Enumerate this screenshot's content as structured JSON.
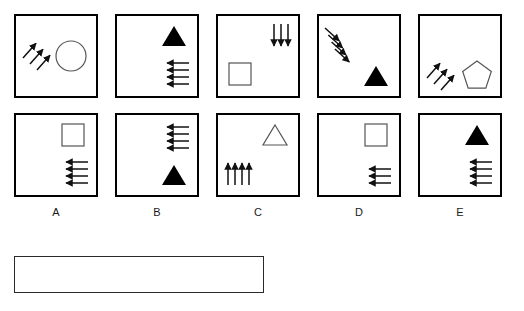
{
  "layout": {
    "columns": 5,
    "rows": 2,
    "panel_size": 84,
    "grid_origin": {
      "x": 14,
      "y": 14
    },
    "column_gap": 101,
    "row_gap": 99
  },
  "colors": {
    "panel_border": "#000000",
    "filled_shape": "#000000",
    "outline_shape": "#555555",
    "arrow": "#111111",
    "answer_box_border": "#2a2a2a",
    "background": "#ffffff",
    "label_text": "#1a1a1a"
  },
  "column_labels": [
    "A",
    "B",
    "C",
    "D",
    "E"
  ],
  "panels": [
    {
      "id": "panel-a-top",
      "column": "A",
      "row": "top",
      "shape": {
        "name": "circle",
        "fill": "none",
        "stroke": "#555555",
        "position": "right-middle"
      },
      "arrows": {
        "count": 3,
        "direction": "up-right",
        "position": "left-middle"
      }
    },
    {
      "id": "panel-b-top",
      "column": "B",
      "row": "top",
      "shape": {
        "name": "triangle",
        "fill": "#000000",
        "stroke": "none",
        "position": "top-right"
      },
      "arrows": {
        "count": 4,
        "direction": "left",
        "position": "bottom-right"
      }
    },
    {
      "id": "panel-c-top",
      "column": "C",
      "row": "top",
      "shape": {
        "name": "square",
        "fill": "none",
        "stroke": "#555555",
        "position": "bottom-left"
      },
      "arrows": {
        "count": 3,
        "direction": "down",
        "position": "top-right"
      }
    },
    {
      "id": "panel-d-top",
      "column": "D",
      "row": "top",
      "shape": {
        "name": "triangle",
        "fill": "#000000",
        "stroke": "none",
        "position": "bottom-right"
      },
      "arrows": {
        "count": 4,
        "direction": "down-right",
        "position": "top-left"
      }
    },
    {
      "id": "panel-e-top",
      "column": "E",
      "row": "top",
      "shape": {
        "name": "pentagon",
        "fill": "none",
        "stroke": "#555555",
        "position": "bottom-right"
      },
      "arrows": {
        "count": 3,
        "direction": "up-right",
        "position": "bottom-left"
      }
    },
    {
      "id": "panel-a-bottom",
      "column": "A",
      "row": "bottom",
      "shape": {
        "name": "square",
        "fill": "none",
        "stroke": "#555555",
        "position": "top-right"
      },
      "arrows": {
        "count": 4,
        "direction": "left",
        "position": "bottom-right"
      }
    },
    {
      "id": "panel-b-bottom",
      "column": "B",
      "row": "bottom",
      "shape": {
        "name": "triangle",
        "fill": "#000000",
        "stroke": "none",
        "position": "bottom-right"
      },
      "arrows": {
        "count": 4,
        "direction": "left",
        "position": "top-right"
      }
    },
    {
      "id": "panel-c-bottom",
      "column": "C",
      "row": "bottom",
      "shape": {
        "name": "triangle",
        "fill": "none",
        "stroke": "#555555",
        "position": "top-right"
      },
      "arrows": {
        "count": 4,
        "direction": "up",
        "position": "bottom-left"
      }
    },
    {
      "id": "panel-d-bottom",
      "column": "D",
      "row": "bottom",
      "shape": {
        "name": "square",
        "fill": "none",
        "stroke": "#555555",
        "position": "top-right"
      },
      "arrows": {
        "count": 3,
        "direction": "left",
        "position": "bottom-right"
      }
    },
    {
      "id": "panel-e-bottom",
      "column": "E",
      "row": "bottom",
      "shape": {
        "name": "triangle",
        "fill": "#000000",
        "stroke": "none",
        "position": "top-right"
      },
      "arrows": {
        "count": 4,
        "direction": "left",
        "position": "bottom-right"
      }
    }
  ],
  "answer_box": {
    "value": "",
    "placeholder": ""
  }
}
